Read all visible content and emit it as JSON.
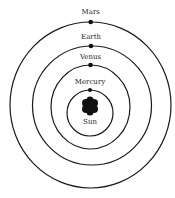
{
  "diagram": {
    "title": "",
    "colors": {
      "stroke": "#1a1a1a",
      "background": "#ffffff",
      "text": "#222222"
    },
    "center": {
      "label": "Sun"
    },
    "orbits": [
      {
        "name": "Mercury",
        "label": "Mercury"
      },
      {
        "name": "Venus",
        "label": "Venus"
      },
      {
        "name": "Earth",
        "label": "Earth"
      },
      {
        "name": "Mars",
        "label": "Mars"
      }
    ]
  }
}
